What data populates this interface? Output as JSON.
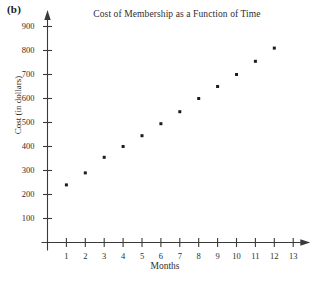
{
  "panel": {
    "label": "(b)"
  },
  "chart_data": {
    "type": "scatter",
    "title": "Cost of Membership as a Function of Time",
    "xlabel": "Months",
    "ylabel": "Cost (in dollars)",
    "x": [
      1,
      2,
      3,
      4,
      5,
      6,
      7,
      8,
      9,
      10,
      11,
      12
    ],
    "values": [
      240,
      290,
      355,
      400,
      445,
      495,
      545,
      600,
      650,
      700,
      755,
      810
    ],
    "series": [
      {
        "name": "Cost of Membership",
        "points": [
          {
            "x": 1,
            "y": 240
          },
          {
            "x": 2,
            "y": 290
          },
          {
            "x": 3,
            "y": 355
          },
          {
            "x": 4,
            "y": 400
          },
          {
            "x": 5,
            "y": 445
          },
          {
            "x": 6,
            "y": 495
          },
          {
            "x": 7,
            "y": 545
          },
          {
            "x": 8,
            "y": 600
          },
          {
            "x": 9,
            "y": 650
          },
          {
            "x": 10,
            "y": 700
          },
          {
            "x": 11,
            "y": 755
          },
          {
            "x": 12,
            "y": 810
          }
        ]
      }
    ],
    "xticks": [
      1,
      2,
      3,
      4,
      5,
      6,
      7,
      8,
      9,
      10,
      11,
      12,
      13
    ],
    "yticks": [
      100,
      200,
      300,
      400,
      500,
      600,
      700,
      800,
      900
    ],
    "xlim": [
      0,
      13.8
    ],
    "ylim": [
      0,
      960
    ],
    "grid": false,
    "legend": null,
    "marker": "square",
    "marker_color": "#1c1c1c",
    "axis_color": "#3a3a3a",
    "axis_arrows": true
  }
}
